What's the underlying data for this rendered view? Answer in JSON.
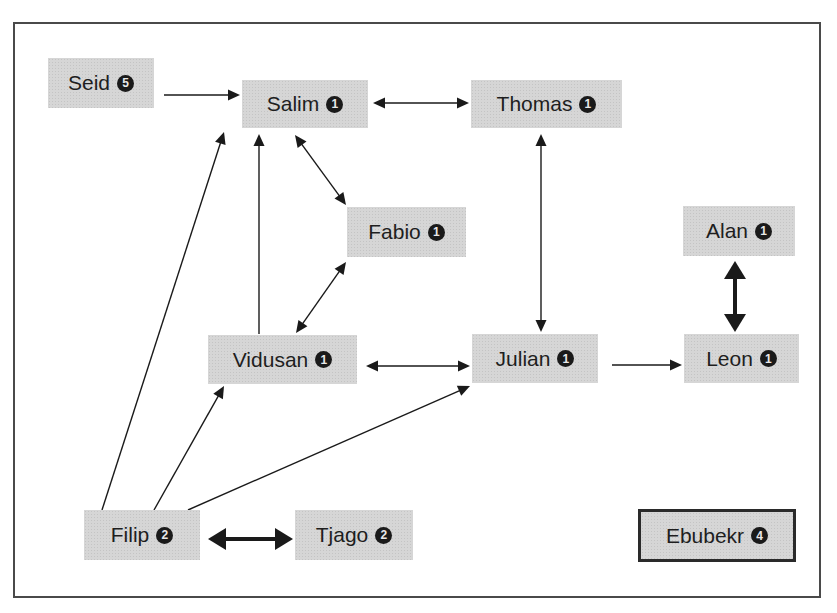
{
  "diagram": {
    "type": "directed-network",
    "colors": {
      "node_fill": "#d6d6d6",
      "edge": "#1a1a1a",
      "frame": "#4a4a4a",
      "badge": "#1a1a1a"
    },
    "nodes": [
      {
        "id": "seid",
        "label": "Seid",
        "badge": "5",
        "x": 48,
        "y": 58,
        "w": 106,
        "h": 50
      },
      {
        "id": "salim",
        "label": "Salim",
        "badge": "1",
        "x": 242,
        "y": 80,
        "w": 126,
        "h": 48
      },
      {
        "id": "thomas",
        "label": "Thomas",
        "badge": "1",
        "x": 471,
        "y": 80,
        "w": 151,
        "h": 48
      },
      {
        "id": "fabio",
        "label": "Fabio",
        "badge": "1",
        "x": 347,
        "y": 207,
        "w": 119,
        "h": 50
      },
      {
        "id": "alan",
        "label": "Alan",
        "badge": "1",
        "x": 683,
        "y": 206,
        "w": 112,
        "h": 50
      },
      {
        "id": "vidusan",
        "label": "Vidusan",
        "badge": "1",
        "x": 208,
        "y": 335,
        "w": 149,
        "h": 49
      },
      {
        "id": "julian",
        "label": "Julian",
        "badge": "1",
        "x": 472,
        "y": 334,
        "w": 126,
        "h": 49
      },
      {
        "id": "leon",
        "label": "Leon",
        "badge": "1",
        "x": 684,
        "y": 334,
        "w": 115,
        "h": 49
      },
      {
        "id": "filip",
        "label": "Filip",
        "badge": "2",
        "x": 84,
        "y": 510,
        "w": 116,
        "h": 50
      },
      {
        "id": "tjago",
        "label": "Tjago",
        "badge": "2",
        "x": 295,
        "y": 510,
        "w": 118,
        "h": 50
      },
      {
        "id": "ebubekr",
        "label": "Ebubekr",
        "badge": "4",
        "x": 638,
        "y": 509,
        "w": 158,
        "h": 53,
        "bordered": true
      }
    ],
    "edges": [
      {
        "from": "seid",
        "to": "salim",
        "direction": "forward",
        "weight": "thin",
        "x1": 164,
        "y1": 95,
        "x2": 240,
        "y2": 95
      },
      {
        "from": "salim",
        "to": "thomas",
        "direction": "bidirectional",
        "weight": "thin",
        "x1": 373,
        "y1": 103,
        "x2": 469,
        "y2": 103
      },
      {
        "from": "salim",
        "to": "fabio",
        "direction": "bidirectional",
        "weight": "thin",
        "x1": 295,
        "y1": 135,
        "x2": 346,
        "y2": 205
      },
      {
        "from": "fabio",
        "to": "vidusan",
        "direction": "bidirectional",
        "weight": "thin",
        "x1": 346,
        "y1": 262,
        "x2": 296,
        "y2": 333
      },
      {
        "from": "vidusan",
        "to": "salim",
        "direction": "forward",
        "weight": "thin",
        "x1": 259,
        "y1": 334,
        "x2": 259,
        "y2": 134
      },
      {
        "from": "thomas",
        "to": "julian",
        "direction": "bidirectional",
        "weight": "thin",
        "x1": 541,
        "y1": 134,
        "x2": 541,
        "y2": 332
      },
      {
        "from": "vidusan",
        "to": "julian",
        "direction": "bidirectional",
        "weight": "thin",
        "x1": 366,
        "y1": 366,
        "x2": 470,
        "y2": 366
      },
      {
        "from": "julian",
        "to": "leon",
        "direction": "forward",
        "weight": "thin",
        "x1": 612,
        "y1": 365,
        "x2": 682,
        "y2": 365
      },
      {
        "from": "alan",
        "to": "leon",
        "direction": "bidirectional",
        "weight": "thick",
        "x1": 735,
        "y1": 261,
        "x2": 735,
        "y2": 332
      },
      {
        "from": "filip",
        "to": "salim",
        "direction": "forward",
        "weight": "thin",
        "x1": 102,
        "y1": 510,
        "x2": 224,
        "y2": 132
      },
      {
        "from": "filip",
        "to": "vidusan",
        "direction": "forward",
        "weight": "thin",
        "x1": 154,
        "y1": 510,
        "x2": 224,
        "y2": 386
      },
      {
        "from": "filip",
        "to": "julian",
        "direction": "forward",
        "weight": "thin",
        "x1": 188,
        "y1": 510,
        "x2": 470,
        "y2": 386
      },
      {
        "from": "filip",
        "to": "tjago",
        "direction": "bidirectional",
        "weight": "thick",
        "x1": 208,
        "y1": 539,
        "x2": 293,
        "y2": 539
      }
    ]
  },
  "nodes_text": {
    "seid": {
      "label": "Seid",
      "badge": "5"
    },
    "salim": {
      "label": "Salim",
      "badge": "1"
    },
    "thomas": {
      "label": "Thomas",
      "badge": "1"
    },
    "fabio": {
      "label": "Fabio",
      "badge": "1"
    },
    "alan": {
      "label": "Alan",
      "badge": "1"
    },
    "vidusan": {
      "label": "Vidusan",
      "badge": "1"
    },
    "julian": {
      "label": "Julian",
      "badge": "1"
    },
    "leon": {
      "label": "Leon",
      "badge": "1"
    },
    "filip": {
      "label": "Filip",
      "badge": "2"
    },
    "tjago": {
      "label": "Tjago",
      "badge": "2"
    },
    "ebubekr": {
      "label": "Ebubekr",
      "badge": "4"
    }
  }
}
